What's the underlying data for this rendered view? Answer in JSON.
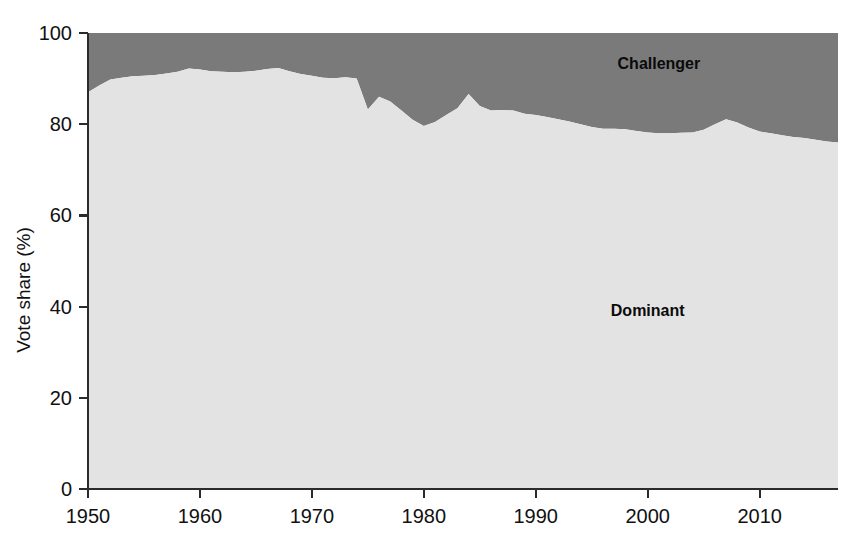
{
  "chart_data": {
    "type": "area",
    "stacked": true,
    "title": "",
    "xlabel": "",
    "ylabel": "Vote share (%)",
    "xlim": [
      1950,
      2017
    ],
    "ylim": [
      0,
      100
    ],
    "grid": false,
    "legend_position": "inline-annotation",
    "x_ticks": [
      1950,
      1960,
      1970,
      1980,
      1990,
      2000,
      2010
    ],
    "x_tick_labels": [
      "1950",
      "1960",
      "1970",
      "1980",
      "1990",
      "2000",
      "2010"
    ],
    "y_ticks": [
      0,
      20,
      40,
      60,
      80,
      100
    ],
    "y_tick_labels": [
      "0",
      "20",
      "40",
      "60",
      "80",
      "100"
    ],
    "annotations": [
      {
        "text": "Challenger",
        "x": 2001,
        "y": 92
      },
      {
        "text": "Dominant",
        "x": 2000,
        "y": 38
      }
    ],
    "colors": {
      "dominant": "#e3e3e3",
      "challenger": "#7a7a7a",
      "axis": "#2b2b2b",
      "text": "#111111"
    },
    "x": [
      1950,
      1951,
      1952,
      1953,
      1954,
      1955,
      1956,
      1957,
      1958,
      1959,
      1960,
      1961,
      1962,
      1963,
      1964,
      1965,
      1966,
      1967,
      1968,
      1969,
      1970,
      1971,
      1972,
      1973,
      1974,
      1975,
      1976,
      1977,
      1978,
      1979,
      1980,
      1981,
      1982,
      1983,
      1984,
      1985,
      1986,
      1987,
      1988,
      1989,
      1990,
      1991,
      1992,
      1993,
      1994,
      1995,
      1996,
      1997,
      1998,
      1999,
      2000,
      2001,
      2002,
      2003,
      2004,
      2005,
      2006,
      2007,
      2008,
      2009,
      2010,
      2011,
      2012,
      2013,
      2014,
      2015,
      2016,
      2017
    ],
    "series": [
      {
        "name": "Dominant",
        "color": "#e3e3e3",
        "values": [
          87.0,
          88.5,
          89.8,
          90.2,
          90.5,
          90.6,
          90.8,
          91.1,
          91.5,
          92.2,
          92.0,
          91.6,
          91.5,
          91.4,
          91.5,
          91.7,
          92.1,
          92.3,
          91.6,
          91.0,
          90.6,
          90.2,
          90.1,
          90.3,
          90.0,
          83.2,
          86.0,
          85.0,
          83.0,
          81.0,
          79.6,
          80.5,
          82.0,
          83.5,
          86.6,
          84.0,
          83.0,
          83.1,
          83.0,
          82.3,
          82.0,
          81.6,
          81.1,
          80.6,
          80.0,
          79.4,
          79.0,
          79.0,
          78.9,
          78.5,
          78.2,
          78.0,
          78.0,
          78.1,
          78.2,
          78.8,
          80.0,
          81.1,
          80.4,
          79.3,
          78.4,
          78.0,
          77.6,
          77.2,
          77.0,
          76.6,
          76.2,
          76.0
        ]
      },
      {
        "name": "Challenger",
        "color": "#7a7a7a",
        "values": [
          13.0,
          11.5,
          10.2,
          9.8,
          9.5,
          9.4,
          9.2,
          8.9,
          8.5,
          7.8,
          8.0,
          8.4,
          8.5,
          8.6,
          8.5,
          8.3,
          7.9,
          7.7,
          8.4,
          9.0,
          9.4,
          9.8,
          9.9,
          9.7,
          10.0,
          16.8,
          14.0,
          15.0,
          17.0,
          19.0,
          20.4,
          19.5,
          18.0,
          16.5,
          13.4,
          16.0,
          17.0,
          16.9,
          17.0,
          17.7,
          18.0,
          18.4,
          18.9,
          19.4,
          20.0,
          20.6,
          21.0,
          21.0,
          21.1,
          21.5,
          21.8,
          22.0,
          22.0,
          21.9,
          21.8,
          21.2,
          20.0,
          18.9,
          19.6,
          20.7,
          21.6,
          22.0,
          22.4,
          22.8,
          23.0,
          23.4,
          23.8,
          24.0
        ]
      }
    ]
  },
  "axis": {
    "y_title": "Vote share (%)"
  }
}
